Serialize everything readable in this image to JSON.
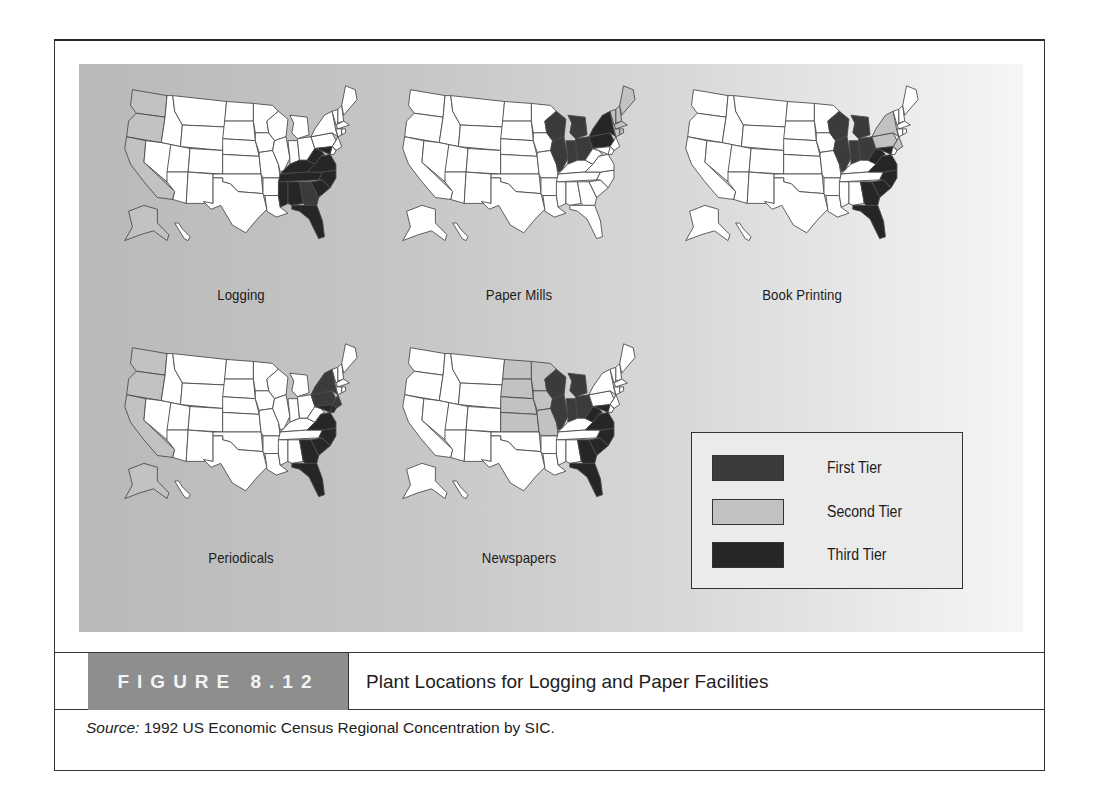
{
  "figure": {
    "number_label": "FIGURE 8.12",
    "title": "Plant Locations for Logging and Paper Facilities",
    "source_prefix": "Source:",
    "source_text": " 1992 US Economic Census Regional Concentration by SIC."
  },
  "colors": {
    "first_tier": "#3b3b3b",
    "second_tier": "#c2c2c2",
    "third_tier": "#262626",
    "none": "#ffffff",
    "caption_box": "#8e8e8e"
  },
  "legend": {
    "items": [
      {
        "key": "first_tier",
        "label": "First Tier"
      },
      {
        "key": "second_tier",
        "label": "Second Tier"
      },
      {
        "key": "third_tier",
        "label": "Third Tier"
      }
    ]
  },
  "maps": [
    {
      "label": "Logging",
      "second_tier": [
        "WA",
        "OR",
        "CA",
        "AK"
      ],
      "first_tier": [
        "GA"
      ],
      "third_tier": [
        "KY",
        "TN",
        "WV",
        "VA",
        "NC",
        "SC",
        "AL",
        "MS",
        "FL",
        "MD"
      ]
    },
    {
      "label": "Paper Mills",
      "second_tier": [
        "ME",
        "NH",
        "VT",
        "MA",
        "CT",
        "RI"
      ],
      "first_tier": [
        "WI",
        "MI",
        "IL",
        "IN",
        "OH"
      ],
      "third_tier": [
        "PA",
        "NY"
      ]
    },
    {
      "label": "Book Printing",
      "second_tier": [
        "NY",
        "PA",
        "NJ"
      ],
      "first_tier": [
        "WI",
        "MI",
        "IL",
        "IN",
        "OH"
      ],
      "third_tier": [
        "WV",
        "VA",
        "MD",
        "NC",
        "SC",
        "GA",
        "FL"
      ]
    },
    {
      "label": "Periodicals",
      "second_tier": [
        "WA",
        "OR",
        "CA",
        "AK"
      ],
      "first_tier": [
        "NY",
        "PA",
        "NJ"
      ],
      "third_tier": [
        "MD",
        "VA",
        "NC",
        "SC",
        "GA",
        "FL",
        "DE"
      ]
    },
    {
      "label": "Newspapers",
      "second_tier": [
        "ND",
        "SD",
        "NE",
        "KS",
        "MN",
        "IA",
        "MO"
      ],
      "first_tier": [
        "WI",
        "MI",
        "IL",
        "IN",
        "OH"
      ],
      "third_tier": [
        "WV",
        "VA",
        "NC",
        "SC",
        "GA",
        "FL",
        "MD"
      ]
    }
  ]
}
